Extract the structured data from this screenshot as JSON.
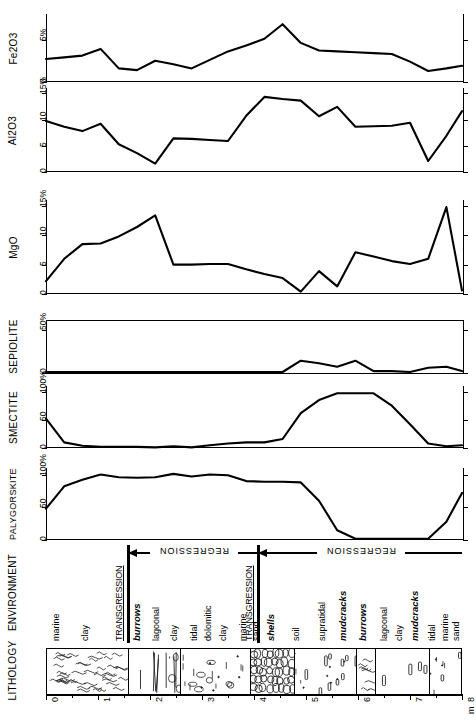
{
  "figure": {
    "orientation": "rotated-90",
    "depth_unit": "m",
    "depth_range": [
      0,
      8
    ]
  },
  "chart_data": {
    "type": "line",
    "xlabel": "Depth (m)",
    "xlim": [
      0,
      8
    ],
    "grid": false,
    "legend": "none",
    "x": [
      0.0,
      0.35,
      0.7,
      1.05,
      1.4,
      1.75,
      2.1,
      2.45,
      2.8,
      3.15,
      3.5,
      3.85,
      4.2,
      4.55,
      4.9,
      5.25,
      5.6,
      5.95,
      6.3,
      6.65,
      7.0,
      7.35,
      7.7,
      8.0
    ],
    "panels": [
      {
        "name": "Fe2O3",
        "label": "Fe2O3",
        "ylabel": "%",
        "ylim": [
          0,
          8
        ],
        "yticks": [
          0,
          5
        ],
        "ytick_labels": [
          "0",
          "5%"
        ],
        "values": [
          2.7,
          2.9,
          3.1,
          3.9,
          1.6,
          1.4,
          2.5,
          2.1,
          1.6,
          2.6,
          3.6,
          4.3,
          5.1,
          6.8,
          4.6,
          3.7,
          3.6,
          3.5,
          3.4,
          3.3,
          2.4,
          1.3,
          1.6,
          1.9
        ]
      },
      {
        "name": "Al2O3",
        "label": "Al2O3",
        "ylabel": "%",
        "ylim": [
          0,
          16
        ],
        "yticks": [
          0,
          5,
          10,
          15
        ],
        "ytick_labels": [
          "0",
          "5",
          "10",
          "15%"
        ],
        "values": [
          9.7,
          8.6,
          7.8,
          9.2,
          5.3,
          3.6,
          1.6,
          6.4,
          6.3,
          6.1,
          5.9,
          10.7,
          14.3,
          13.9,
          13.6,
          10.6,
          12.4,
          8.6,
          8.7,
          8.8,
          9.4,
          2.1,
          6.9,
          11.6
        ]
      },
      {
        "name": "MgO",
        "label": "MgO",
        "ylabel": "%",
        "ylim": [
          0,
          16
        ],
        "yticks": [
          0,
          5,
          10,
          15
        ],
        "ytick_labels": [
          "0",
          "5",
          "10",
          "15%"
        ],
        "values": [
          2.2,
          6.0,
          8.5,
          8.6,
          9.8,
          11.4,
          13.4,
          5.0,
          5.0,
          5.1,
          5.1,
          4.2,
          3.4,
          2.7,
          0.4,
          3.9,
          1.3,
          7.1,
          6.4,
          5.6,
          5.1,
          6.0,
          14.8,
          0.6
        ]
      },
      {
        "name": "SEPIOLITE",
        "label": "SEPIOLITE",
        "ylabel": "%",
        "ylim": [
          0,
          60
        ],
        "yticks": [
          0,
          50
        ],
        "ytick_labels": [
          "0",
          "50%"
        ],
        "values": [
          0,
          0,
          0,
          0,
          0,
          0,
          0,
          0,
          0,
          0,
          0,
          0,
          0,
          0,
          13,
          10,
          6,
          13,
          1,
          1,
          0,
          5,
          6,
          1
        ]
      },
      {
        "name": "SMECTITE",
        "label": "SMECTITE",
        "ylabel": "%",
        "ylim": [
          0,
          110
        ],
        "yticks": [
          0,
          50,
          100
        ],
        "ytick_labels": [
          "0",
          "50",
          "100%"
        ],
        "values": [
          52,
          10,
          4,
          2,
          2,
          2,
          1,
          3,
          1,
          5,
          8,
          10,
          10,
          16,
          62,
          85,
          97,
          97,
          97,
          75,
          42,
          8,
          3,
          5
        ]
      },
      {
        "name": "PALYGORSKITE",
        "label": "PALYGORSKITE",
        "ylabel": "%",
        "ylim": [
          0,
          110
        ],
        "yticks": [
          0,
          50,
          100
        ],
        "ytick_labels": [
          "0",
          "50",
          "100%"
        ],
        "values": [
          48,
          82,
          92,
          100,
          96,
          95,
          96,
          101,
          97,
          100,
          99,
          90,
          89,
          89,
          88,
          60,
          15,
          2,
          2,
          2,
          2,
          2,
          28,
          72
        ]
      }
    ],
    "panel_order_top_to_bottom": [
      "Fe2O3",
      "Al2O3",
      "MgO",
      "SEPIOLITE",
      "SMECTITE",
      "PALYGORSKITE"
    ]
  },
  "environment": {
    "title": "ENVIRONMENT",
    "events": [
      {
        "label": "TRANSGRESSION",
        "at_depth": 1.55
      },
      {
        "label": "TRANSGRESSION",
        "at_depth": 4.05
      }
    ],
    "cycles": [
      {
        "label": "REGRESSION",
        "from_depth": 1.55,
        "to_depth": 4.05
      },
      {
        "label": "REGRESSION",
        "from_depth": 4.05,
        "to_depth": 8.0
      }
    ],
    "labels": [
      {
        "text": "marine",
        "depth": 0.28,
        "emphasis": "normal"
      },
      {
        "text": "clay",
        "depth": 0.85,
        "emphasis": "normal"
      },
      {
        "text": "burrows",
        "depth": 1.85,
        "emphasis": "bold"
      },
      {
        "text": "lagoonal",
        "depth": 2.22,
        "emphasis": "normal"
      },
      {
        "text": "clay",
        "depth": 2.55,
        "emphasis": "normal"
      },
      {
        "text": "tidal",
        "depth": 2.95,
        "emphasis": "normal"
      },
      {
        "text": "dolomitic",
        "depth": 3.22,
        "emphasis": "normal"
      },
      {
        "text": "clay",
        "depth": 3.5,
        "emphasis": "normal"
      },
      {
        "text": "marine",
        "depth": 3.88,
        "emphasis": "normal"
      },
      {
        "text": "sand",
        "depth": 4.14,
        "emphasis": "normal"
      },
      {
        "text": "shells",
        "depth": 4.42,
        "emphasis": "bold"
      },
      {
        "text": "soil",
        "depth": 4.9,
        "emphasis": "normal"
      },
      {
        "text": "supratidal",
        "depth": 5.4,
        "emphasis": "normal"
      },
      {
        "text": "mudcracks",
        "depth": 5.8,
        "emphasis": "bold"
      },
      {
        "text": "burrows",
        "depth": 6.2,
        "emphasis": "bold"
      },
      {
        "text": "lagoonal",
        "depth": 6.6,
        "emphasis": "normal"
      },
      {
        "text": "clay",
        "depth": 6.88,
        "emphasis": "normal"
      },
      {
        "text": "mudcracks",
        "depth": 7.2,
        "emphasis": "bold"
      },
      {
        "text": "tidal",
        "depth": 7.52,
        "emphasis": "normal"
      },
      {
        "text": "marine",
        "depth": 7.76,
        "emphasis": "normal"
      },
      {
        "text": "sand",
        "depth": 7.98,
        "emphasis": "normal"
      }
    ]
  },
  "lithology": {
    "title": "LITHOLOGY",
    "units": [
      {
        "from_depth": 0.0,
        "to_depth": 1.55,
        "pattern": "squiggly-clay"
      },
      {
        "from_depth": 1.55,
        "to_depth": 2.55,
        "pattern": "burrowed-mottled"
      },
      {
        "from_depth": 2.55,
        "to_depth": 3.9,
        "pattern": "silty-nodular"
      },
      {
        "from_depth": 3.9,
        "to_depth": 4.75,
        "pattern": "brecciated-nodular"
      },
      {
        "from_depth": 4.75,
        "to_depth": 5.95,
        "pattern": "mudcracked-sandy"
      },
      {
        "from_depth": 5.95,
        "to_depth": 6.3,
        "pattern": "squiggly-clay"
      },
      {
        "from_depth": 6.3,
        "to_depth": 7.35,
        "pattern": "sparse-blocky"
      },
      {
        "from_depth": 7.35,
        "to_depth": 8.0,
        "pattern": "mudcracked-sandy"
      }
    ]
  },
  "depth_scale": {
    "unit_label": "m",
    "major_ticks": [
      0,
      1,
      2,
      3,
      4,
      5,
      6,
      7,
      8
    ],
    "major_labels": [
      "0",
      "1",
      "2",
      "3",
      "4",
      "5",
      "6",
      "7",
      "8"
    ],
    "minor_tick_step": 0.5
  }
}
